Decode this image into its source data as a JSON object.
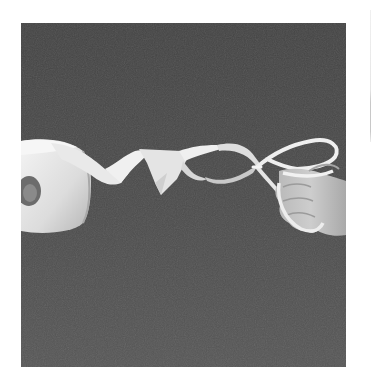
{
  "image": {
    "description": "Grayscale photograph: a roll of white tape at left unwinding into a twisted ribbon that forms a figure-eight loop held by a hand at right, against a dark gray background",
    "colors": {
      "page_background": "#ffffff",
      "backdrop_top": "#444444",
      "backdrop_bottom": "#565656",
      "tape_highlight": "#f2f2f2",
      "tape_shadow": "#bdbdbd",
      "roll_hole": "#6a6a6a",
      "skin_light": "#cfcfcf",
      "skin_shadow": "#9a9a9a",
      "edge_line": "#c8c8c8"
    },
    "objects": [
      {
        "name": "tape-roll",
        "position": "left edge, vertically centered"
      },
      {
        "name": "twisted-tape-ribbon",
        "position": "center"
      },
      {
        "name": "figure-eight-loop",
        "position": "center-right"
      },
      {
        "name": "hand",
        "position": "right edge"
      }
    ]
  }
}
